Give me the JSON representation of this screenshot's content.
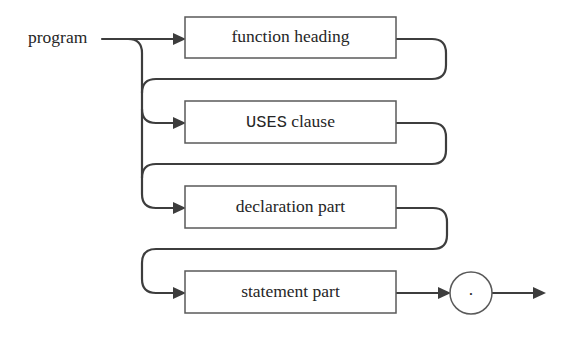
{
  "diagram": {
    "start_label": "program",
    "nodes": [
      {
        "id": "function-heading",
        "label": "function heading"
      },
      {
        "id": "uses-clause",
        "label_keyword": "USES",
        "label_rest": " clause"
      },
      {
        "id": "declaration-part",
        "label": "declaration part"
      },
      {
        "id": "statement-part",
        "label": "statement part"
      }
    ],
    "terminal": {
      "symbol": "."
    },
    "edges": [
      {
        "from": "program",
        "to": "function-heading"
      },
      {
        "from": "program",
        "to": "uses-clause"
      },
      {
        "from": "program",
        "to": "declaration-part"
      },
      {
        "from": "function-heading",
        "to": "uses-clause"
      },
      {
        "from": "function-heading",
        "to": "declaration-part"
      },
      {
        "from": "uses-clause",
        "to": "declaration-part"
      },
      {
        "from": "declaration-part",
        "to": "statement-part"
      },
      {
        "from": "statement-part",
        "to": "terminal"
      },
      {
        "from": "terminal",
        "to": "end"
      }
    ]
  },
  "colors": {
    "line": "#3d3d3d",
    "box_border": "#5a5a5a",
    "text": "#262626",
    "background": "#ffffff"
  }
}
